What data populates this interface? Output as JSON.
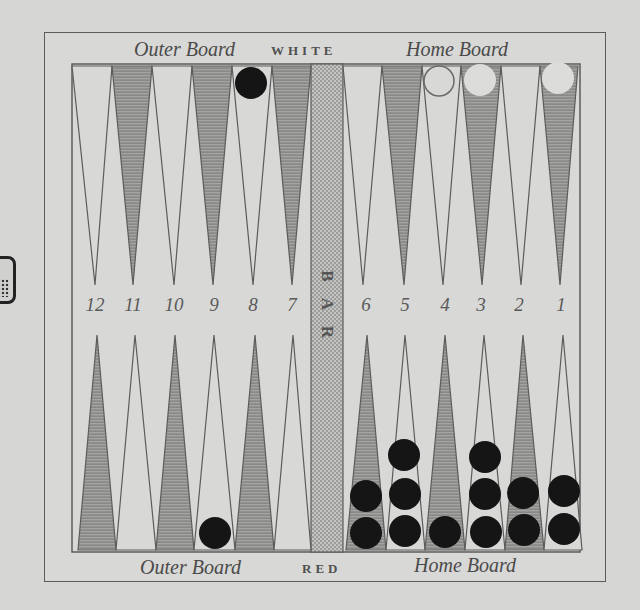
{
  "board": {
    "top_labels": {
      "outer": "Outer Board",
      "player": "WHITE",
      "home": "Home Board"
    },
    "bottom_labels": {
      "outer": "Outer Board",
      "player": "RED",
      "home": "Home Board"
    },
    "bar_label": [
      "B",
      "A",
      "R"
    ],
    "point_numbers": [
      "12",
      "11",
      "10",
      "9",
      "8",
      "7",
      "6",
      "5",
      "4",
      "3",
      "2",
      "1"
    ],
    "colors": {
      "paper": "#d6d6d4",
      "line": "#5c5c5c",
      "shaded_point": "#8c8c8a",
      "black_checker": "#151515",
      "white_checker": "#dcdcda"
    }
  },
  "checkers": {
    "top": [
      {
        "column_above": "8",
        "color": "black",
        "count": 1
      },
      {
        "column_above": "4",
        "color": "white-outline",
        "count": 1
      },
      {
        "column_above": "3",
        "color": "white",
        "count": 1
      },
      {
        "column_above": "1",
        "color": "white",
        "count": 1
      }
    ],
    "bottom": [
      {
        "point": "9",
        "color": "black",
        "count": 1
      },
      {
        "point": "6",
        "color": "black",
        "count": 2
      },
      {
        "point": "5",
        "color": "black",
        "count": 3
      },
      {
        "point": "4",
        "color": "black",
        "count": 1
      },
      {
        "point": "3",
        "color": "black",
        "count": 3
      },
      {
        "point": "2",
        "color": "black",
        "count": 2
      },
      {
        "point": "1",
        "color": "black",
        "count": 2
      }
    ]
  },
  "decor": {
    "die": "die-icon"
  }
}
